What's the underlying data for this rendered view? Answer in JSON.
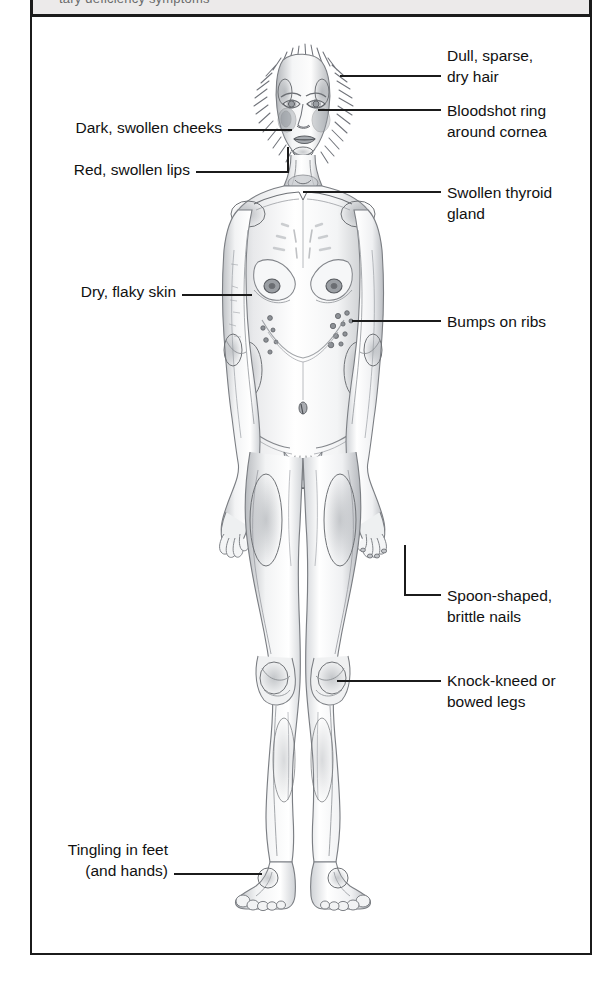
{
  "header": {
    "band_text": "tary deficiency symptoms",
    "band_color": "#eceaea",
    "rule_color": "#1b1b1b"
  },
  "figure": {
    "style": "grayscale-pencil-stipple-medical-illustration",
    "frame_color": "#1b1b1b",
    "background": "#ffffff",
    "ink_color": "#8e9094"
  },
  "callouts": {
    "right": [
      {
        "id": "hair",
        "name": "dull-sparse-dry-hair",
        "text": "Dull, sparse,\ndry hair",
        "text_x": 447,
        "text_y": 45,
        "leader": {
          "type": "straight",
          "x1": 340,
          "y1": 76,
          "x2": 441,
          "y2": 76
        }
      },
      {
        "id": "cornea",
        "name": "bloodshot-ring-cornea",
        "text": "Bloodshot ring\naround cornea",
        "text_x": 447,
        "text_y": 100,
        "leader": {
          "type": "straight",
          "x1": 318,
          "y1": 110,
          "x2": 441,
          "y2": 110
        }
      },
      {
        "id": "thyroid",
        "name": "swollen-thyroid-gland",
        "text": "Swollen thyroid\ngland",
        "text_x": 447,
        "text_y": 182,
        "leader": {
          "type": "straight",
          "x1": 303,
          "y1": 192,
          "x2": 441,
          "y2": 192
        }
      },
      {
        "id": "ribs",
        "name": "bumps-on-ribs",
        "text": "Bumps on ribs",
        "text_x": 447,
        "text_y": 311,
        "leader": {
          "type": "straight",
          "x1": 352,
          "y1": 321,
          "x2": 441,
          "y2": 321
        }
      },
      {
        "id": "nails",
        "name": "spoon-shaped-brittle-nails",
        "text": "Spoon-shaped,\nbrittle nails",
        "text_x": 447,
        "text_y": 585,
        "leader": {
          "type": "elbow",
          "x1": 405,
          "y1": 545,
          "x2": 405,
          "y2": 595,
          "x3": 441,
          "y3": 595
        }
      },
      {
        "id": "legs",
        "name": "knock-kneed-or-bowed-legs",
        "text": "Knock-kneed or\nbowed legs",
        "text_x": 447,
        "text_y": 670,
        "leader": {
          "type": "straight",
          "x1": 337,
          "y1": 681,
          "x2": 441,
          "y2": 681
        }
      }
    ],
    "left": [
      {
        "id": "cheeks",
        "name": "dark-swollen-cheeks",
        "text": "Dark, swollen cheeks",
        "text_right": 222,
        "text_y": 117,
        "leader": {
          "type": "straight",
          "x1": 228,
          "y1": 130,
          "x2": 292,
          "y2": 130
        }
      },
      {
        "id": "lips",
        "name": "red-swollen-lips",
        "text": "Red, swollen lips",
        "text_right": 190,
        "text_y": 159,
        "leader": {
          "type": "elbow-up",
          "x1": 196,
          "y1": 172,
          "x2": 288,
          "y2": 172,
          "x3": 288,
          "y3": 148
        }
      },
      {
        "id": "skin",
        "name": "dry-flaky-skin",
        "text": "Dry, flaky skin",
        "text_right": 176,
        "text_y": 281,
        "leader": {
          "type": "straight",
          "x1": 182,
          "y1": 295,
          "x2": 252,
          "y2": 295
        }
      },
      {
        "id": "feet",
        "name": "tingling-in-feet",
        "text": "Tingling in feet\n(and hands)",
        "text_right": 168,
        "text_y": 839,
        "leader": {
          "type": "straight",
          "x1": 174,
          "y1": 874,
          "x2": 262,
          "y2": 874
        }
      }
    ]
  }
}
